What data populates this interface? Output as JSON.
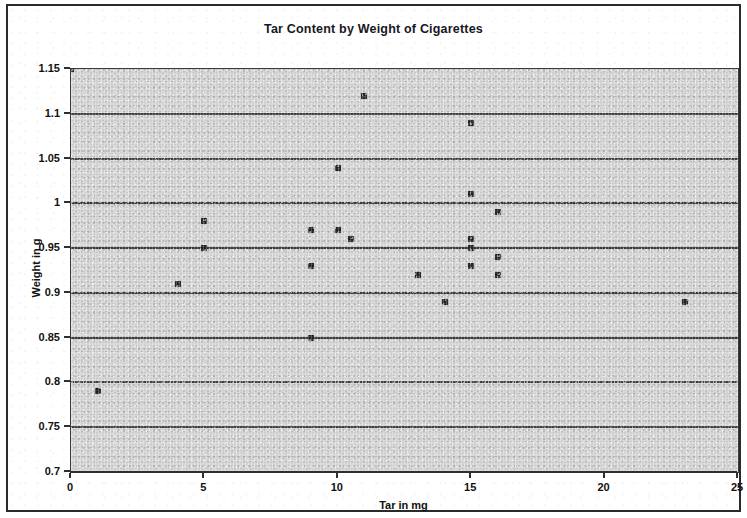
{
  "chart_data": {
    "type": "scatter",
    "title": "Tar Content by Weight of Cigarettes",
    "xlabel": "Tar in mg",
    "ylabel": "Weight in g",
    "xlim": [
      0,
      25
    ],
    "ylim": [
      0.7,
      1.15
    ],
    "xticks": [
      "0",
      "5",
      "10",
      "15",
      "20",
      "25"
    ],
    "xtick_values": [
      0,
      5,
      10,
      15,
      20,
      25
    ],
    "yticks": [
      "0.7",
      "0.75",
      "0.8",
      "0.85",
      "0.9",
      "0.95",
      "1",
      "1.05",
      "1.1",
      "1.15"
    ],
    "ytick_values": [
      0.7,
      0.75,
      0.8,
      0.85,
      0.9,
      0.95,
      1.0,
      1.05,
      1.1,
      1.15
    ],
    "grid": "horizontal",
    "legend": "none",
    "marker_color": "#231f1c",
    "plot_background": "#d6d6d6",
    "points": [
      {
        "x": 0,
        "y": 1.15
      },
      {
        "x": 1,
        "y": 0.79
      },
      {
        "x": 4,
        "y": 0.91
      },
      {
        "x": 5,
        "y": 0.98
      },
      {
        "x": 5,
        "y": 0.95
      },
      {
        "x": 9,
        "y": 0.97
      },
      {
        "x": 9,
        "y": 0.93
      },
      {
        "x": 9,
        "y": 0.85
      },
      {
        "x": 10,
        "y": 1.04
      },
      {
        "x": 10,
        "y": 0.97
      },
      {
        "x": 10.5,
        "y": 0.96
      },
      {
        "x": 11,
        "y": 1.12
      },
      {
        "x": 13,
        "y": 0.92
      },
      {
        "x": 14,
        "y": 0.89
      },
      {
        "x": 15,
        "y": 1.09
      },
      {
        "x": 15,
        "y": 1.01
      },
      {
        "x": 15,
        "y": 0.96
      },
      {
        "x": 15,
        "y": 0.95
      },
      {
        "x": 15,
        "y": 0.93
      },
      {
        "x": 16,
        "y": 0.99
      },
      {
        "x": 16,
        "y": 0.94
      },
      {
        "x": 16,
        "y": 0.92
      },
      {
        "x": 23,
        "y": 0.89
      }
    ]
  }
}
